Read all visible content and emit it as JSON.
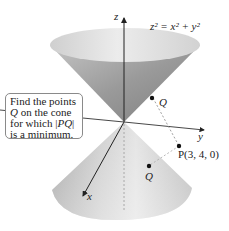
{
  "figure": {
    "equation": "z² = x² + y²",
    "axes": {
      "x_label": "x",
      "y_label": "y",
      "z_label": "z"
    },
    "points": {
      "q_upper_label": "Q",
      "q_lower_label": "Q",
      "p_label": "P(3, 4, 0)"
    },
    "callout": {
      "line1": "Find the points",
      "line2_var": "Q",
      "line2_rest": " on the cone",
      "line3_pre": "for which |",
      "line3_var": "PQ",
      "line3_post": "|",
      "line4": "is a minimum."
    },
    "colors": {
      "cone_light": "#e6e6e6",
      "cone_mid": "#b5b5b5",
      "cone_dark": "#8c8c8c",
      "axis": "#333333",
      "callout_border": "#8a8a8a"
    }
  }
}
